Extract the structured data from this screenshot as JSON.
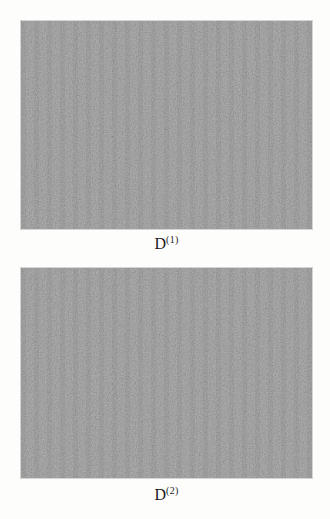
{
  "figure": {
    "page_background": "#fdfdfc",
    "panels": [
      {
        "image": "uniform-gray-noise",
        "fill": "#929292",
        "caption_base": "D",
        "caption_sup": "(1)"
      },
      {
        "image": "uniform-gray-noise",
        "fill": "#929292",
        "caption_base": "D",
        "caption_sup": "(2)"
      }
    ]
  }
}
